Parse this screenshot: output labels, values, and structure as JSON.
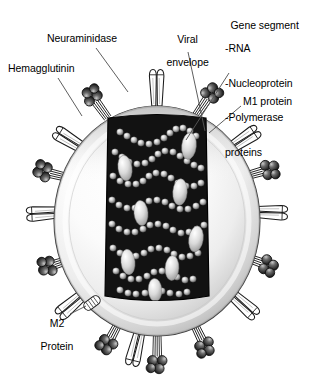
{
  "figure": {
    "background_color": "#ffffff"
  },
  "labels": {
    "neuraminidase": "Neuraminidase",
    "hemagglutinin": "Hemagglutinin",
    "viral_envelope_line1": "Viral",
    "viral_envelope_line2": "envelope",
    "gene_segment_title": "Gene segment",
    "gene_segment_item1": "-RNA",
    "gene_segment_item2": "-Nucleoprotein",
    "gene_segment_item3": "-Polymerase",
    "gene_segment_item4": "proteins",
    "m1_protein": "M1 protein",
    "m2_protein_line1": "M2",
    "m2_protein_line2": "Protein"
  },
  "colors": {
    "envelope_light": "#ffffff",
    "envelope_mid": "#dcdcdc",
    "envelope_shadow": "#a8a8a8",
    "envelope_outline": "#3c3c3c",
    "core_fill": "#121212",
    "core_outline": "#000000",
    "rna_bead_light": "#f2f2f2",
    "rna_bead_mid": "#9a9a9a",
    "nucleoprotein_ellipse": "#d8d8d8",
    "na_head_dark": "#2b2b2b",
    "na_head_highlight": "#bdbdbd",
    "ha_spike_fill": "#ffffff",
    "ha_spike_outline": "#1e1e1e",
    "leader_line": "#555555"
  },
  "structures": {
    "envelope": "viral-envelope-membrane",
    "core": "ribonucleoprotein-core",
    "spikes_hemagglutinin_count": 8,
    "spikes_neuraminidase_count": 8,
    "m2_channel_count": 1,
    "gene_segments_visible": 8
  }
}
